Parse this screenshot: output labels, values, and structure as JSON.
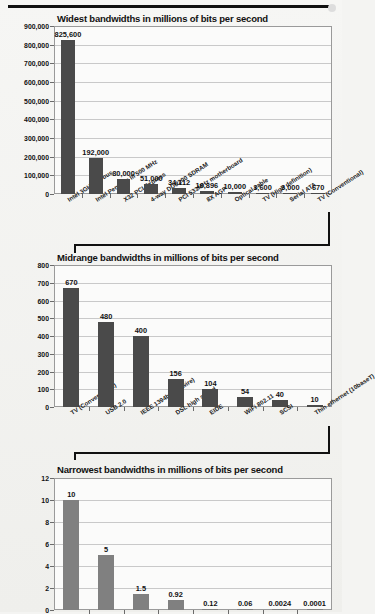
{
  "figure": {
    "background_color": "#f4f4f2",
    "bar_color_dark": "#4a4a4a",
    "bar_color_light": "#808080"
  },
  "chart_data": [
    {
      "type": "bar",
      "title": "Widest bandwidths in millions of bits per second",
      "xlabel": "",
      "ylabel": "Millions of  Bits per second",
      "ylim": [
        0,
        900000
      ],
      "yticks": [
        "0",
        "100,000",
        "200,000",
        "300,000",
        "400,000",
        "500,000",
        "600,000",
        "700,000",
        "800,000",
        "900,000"
      ],
      "ytick_values": [
        0,
        100000,
        200000,
        300000,
        400000,
        500000,
        600000,
        700000,
        800000,
        900000
      ],
      "grid": true,
      "legend": "none",
      "categories": [
        "Intel 3GHz P4 bus",
        "Intel Pentium III  500 MHz",
        "X32 PCI Express",
        "4-way DDR200 SDRAM",
        "PCI 533MHz motherboard",
        "8X AGP",
        "Optical cable",
        "TV (High definition)",
        "Serial ATA",
        "TV (Conventional)"
      ],
      "values": [
        825600,
        192000,
        80000,
        51000,
        34112,
        16896,
        10000,
        3600,
        3000,
        670
      ],
      "value_labels": [
        "825,600",
        "192,000",
        "80,000",
        "51,000",
        "34,112",
        "16,896",
        "10,000",
        "3,600",
        "3,000",
        "670"
      ]
    },
    {
      "type": "bar",
      "title": "Midrange bandwidths in millions of bits per second",
      "xlabel": "",
      "ylabel": "Millions of  Bits per second",
      "ylim": [
        0,
        800
      ],
      "yticks": [
        "0",
        "100",
        "200",
        "300",
        "400",
        "500",
        "600",
        "700",
        "800"
      ],
      "ytick_values": [
        0,
        100,
        200,
        300,
        400,
        500,
        600,
        700,
        800
      ],
      "grid": true,
      "legend": "none",
      "categories": [
        "TV (Conventional)",
        "USB 2.0",
        "IEEE 1394b (Firewire)",
        "DSL high speed",
        "EIDE",
        "WiFi 802.11",
        "SCSI",
        "Thin ethernet (10baseT)"
      ],
      "values": [
        670,
        480,
        400,
        156,
        104,
        54,
        40,
        10
      ],
      "value_labels": [
        "670",
        "480",
        "400",
        "156",
        "104",
        "54",
        "40",
        "10"
      ]
    },
    {
      "type": "bar",
      "title": "Narrowest bandwidths in millions of bits per second",
      "xlabel": "",
      "ylabel": "Millions of  Bits per second",
      "ylim": [
        0,
        12
      ],
      "yticks": [
        "0",
        "2",
        "4",
        "6",
        "8",
        "10",
        "12"
      ],
      "ytick_values": [
        0,
        2,
        4,
        6,
        8,
        10,
        12
      ],
      "grid": true,
      "legend": "none",
      "categories": [
        "",
        "",
        "",
        "",
        "",
        "",
        "",
        ""
      ],
      "values": [
        10,
        5,
        1.5,
        0.92,
        0.12,
        0.06,
        0.0024,
        0.0001
      ],
      "value_labels": [
        "10",
        "5",
        "1.5",
        "0.92",
        "0.12",
        "0.06",
        "0.0024",
        "0.0001"
      ]
    }
  ]
}
